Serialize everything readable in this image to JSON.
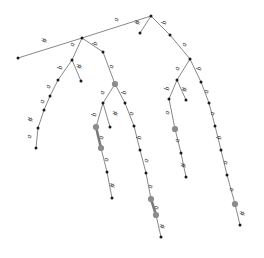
{
  "figure": {
    "alphabet": [
      "a",
      "b",
      "#"
    ],
    "colors": {
      "edge": "#555555",
      "edge_highlight": "#7a7a7a",
      "node": "#1a1a1a",
      "node_highlight": "#8c8c8c",
      "background": "#ffffff"
    },
    "width": 264,
    "height": 258
  },
  "nodes": [
    {
      "id": "n0",
      "x": 151,
      "y": 16,
      "kind": "internal"
    },
    {
      "id": "n1",
      "x": 82,
      "y": 38,
      "kind": "internal"
    },
    {
      "id": "n2",
      "x": 140,
      "y": 33,
      "kind": "leaf"
    },
    {
      "id": "n3",
      "x": 170,
      "y": 35,
      "kind": "internal"
    },
    {
      "id": "n4",
      "x": 18,
      "y": 58,
      "kind": "leaf"
    },
    {
      "id": "n5",
      "x": 72,
      "y": 60,
      "kind": "internal"
    },
    {
      "id": "n6",
      "x": 103,
      "y": 52,
      "kind": "internal"
    },
    {
      "id": "n7",
      "x": 190,
      "y": 59,
      "kind": "internal"
    },
    {
      "id": "n8",
      "x": 58,
      "y": 80,
      "kind": "internal"
    },
    {
      "id": "n9",
      "x": 81,
      "y": 81,
      "kind": "leaf"
    },
    {
      "id": "n10",
      "x": 115,
      "y": 84,
      "kind": "highlight"
    },
    {
      "id": "n11",
      "x": 177,
      "y": 80,
      "kind": "internal"
    },
    {
      "id": "n12",
      "x": 201,
      "y": 82,
      "kind": "internal"
    },
    {
      "id": "n13",
      "x": 50,
      "y": 96,
      "kind": "internal"
    },
    {
      "id": "n14",
      "x": 103,
      "y": 103,
      "kind": "internal"
    },
    {
      "id": "n15",
      "x": 125,
      "y": 103,
      "kind": "internal"
    },
    {
      "id": "n16",
      "x": 169,
      "y": 99,
      "kind": "internal"
    },
    {
      "id": "n17",
      "x": 186,
      "y": 100,
      "kind": "leaf"
    },
    {
      "id": "n18",
      "x": 209,
      "y": 103,
      "kind": "internal"
    },
    {
      "id": "n19",
      "x": 44,
      "y": 110,
      "kind": "internal"
    },
    {
      "id": "n20",
      "x": 96,
      "y": 127,
      "kind": "highlight"
    },
    {
      "id": "n21",
      "x": 110,
      "y": 127,
      "kind": "leaf"
    },
    {
      "id": "n22",
      "x": 134,
      "y": 126,
      "kind": "internal"
    },
    {
      "id": "n23",
      "x": 175,
      "y": 129,
      "kind": "highlight"
    },
    {
      "id": "n24",
      "x": 215,
      "y": 126,
      "kind": "internal"
    },
    {
      "id": "n25",
      "x": 38,
      "y": 128,
      "kind": "internal"
    },
    {
      "id": "n26",
      "x": 101,
      "y": 148,
      "kind": "highlight"
    },
    {
      "id": "n27",
      "x": 140,
      "y": 150,
      "kind": "internal"
    },
    {
      "id": "n28",
      "x": 181,
      "y": 153,
      "kind": "internal"
    },
    {
      "id": "n29",
      "x": 221,
      "y": 150,
      "kind": "internal"
    },
    {
      "id": "n30",
      "x": 36,
      "y": 148,
      "kind": "leaf"
    },
    {
      "id": "n31",
      "x": 107,
      "y": 172,
      "kind": "internal"
    },
    {
      "id": "n32",
      "x": 146,
      "y": 173,
      "kind": "internal"
    },
    {
      "id": "n33",
      "x": 186,
      "y": 177,
      "kind": "leaf"
    },
    {
      "id": "n34",
      "x": 227,
      "y": 175,
      "kind": "internal"
    },
    {
      "id": "n35",
      "x": 112,
      "y": 198,
      "kind": "leaf"
    },
    {
      "id": "n36",
      "x": 151,
      "y": 199,
      "kind": "highlight"
    },
    {
      "id": "n37",
      "x": 156,
      "y": 215,
      "kind": "highlight"
    },
    {
      "id": "n38",
      "x": 235,
      "y": 204,
      "kind": "highlight"
    },
    {
      "id": "n39",
      "x": 161,
      "y": 237,
      "kind": "leaf"
    },
    {
      "id": "n40",
      "x": 240,
      "y": 225,
      "kind": "leaf"
    }
  ],
  "edges": [
    {
      "from": "n0",
      "to": "n1",
      "label": "a",
      "lx": 118,
      "ly": 20,
      "style": "normal"
    },
    {
      "from": "n0",
      "to": "n2",
      "label": "#",
      "lx": 140,
      "ly": 23,
      "style": "normal"
    },
    {
      "from": "n0",
      "to": "n3",
      "label": "b",
      "lx": 166,
      "ly": 23,
      "style": "normal"
    },
    {
      "from": "n1",
      "to": "n4",
      "label": "#",
      "lx": 47,
      "ly": 41,
      "style": "normal"
    },
    {
      "from": "n1",
      "to": "n5",
      "label": "a",
      "lx": 74,
      "ly": 45,
      "style": "normal"
    },
    {
      "from": "n1",
      "to": "n6",
      "label": "b",
      "lx": 97,
      "ly": 44,
      "style": "normal"
    },
    {
      "from": "n3",
      "to": "n7",
      "label": "a",
      "lx": 186,
      "ly": 45,
      "style": "normal"
    },
    {
      "from": "n5",
      "to": "n8",
      "label": "b",
      "lx": 62,
      "ly": 68,
      "style": "normal"
    },
    {
      "from": "n5",
      "to": "n9",
      "label": "#",
      "lx": 82,
      "ly": 67,
      "style": "normal"
    },
    {
      "from": "n6",
      "to": "n10",
      "label": "a",
      "lx": 113,
      "ly": 67,
      "style": "normal"
    },
    {
      "from": "n7",
      "to": "n11",
      "label": "a",
      "lx": 179,
      "ly": 69,
      "style": "normal"
    },
    {
      "from": "n7",
      "to": "n12",
      "label": "b",
      "lx": 201,
      "ly": 69,
      "style": "normal"
    },
    {
      "from": "n8",
      "to": "n13",
      "label": "a",
      "lx": 50,
      "ly": 87,
      "style": "normal"
    },
    {
      "from": "n10",
      "to": "n14",
      "label": "a",
      "lx": 104,
      "ly": 93,
      "style": "normal"
    },
    {
      "from": "n10",
      "to": "n15",
      "label": "b",
      "lx": 126,
      "ly": 93,
      "style": "normal"
    },
    {
      "from": "n11",
      "to": "n16",
      "label": "b",
      "lx": 169,
      "ly": 89,
      "style": "normal"
    },
    {
      "from": "n11",
      "to": "n17",
      "label": "#",
      "lx": 187,
      "ly": 90,
      "style": "normal"
    },
    {
      "from": "n12",
      "to": "n18",
      "label": "a",
      "lx": 208,
      "ly": 92,
      "style": "normal"
    },
    {
      "from": "n13",
      "to": "n19",
      "label": "a",
      "lx": 44,
      "ly": 102,
      "style": "normal"
    },
    {
      "from": "n14",
      "to": "n20",
      "label": "b",
      "lx": 96,
      "ly": 115,
      "style": "normal"
    },
    {
      "from": "n14",
      "to": "n21",
      "label": "#",
      "lx": 118,
      "ly": 114,
      "style": "normal"
    },
    {
      "from": "n15",
      "to": "n22",
      "label": "a",
      "lx": 133,
      "ly": 114,
      "style": "normal"
    },
    {
      "from": "n16",
      "to": "n23",
      "label": "a",
      "lx": 169,
      "ly": 113,
      "style": "normal"
    },
    {
      "from": "n18",
      "to": "n24",
      "label": "a",
      "lx": 214,
      "ly": 114,
      "style": "normal"
    },
    {
      "from": "n19",
      "to": "n25",
      "label": "#",
      "lx": 33,
      "ly": 120,
      "style": "normal"
    },
    {
      "from": "n20",
      "to": "n26",
      "label": "a",
      "lx": 103,
      "ly": 138,
      "style": "thick"
    },
    {
      "from": "n22",
      "to": "n27",
      "label": "b",
      "lx": 141,
      "ly": 138,
      "style": "normal"
    },
    {
      "from": "n23",
      "to": "n28",
      "label": "a",
      "lx": 179,
      "ly": 141,
      "style": "normal"
    },
    {
      "from": "n24",
      "to": "n29",
      "label": "b",
      "lx": 221,
      "ly": 138,
      "style": "normal"
    },
    {
      "from": "n25",
      "to": "n30",
      "label": "a",
      "lx": 31,
      "ly": 137,
      "style": "normal"
    },
    {
      "from": "n26",
      "to": "n31",
      "label": "a",
      "lx": 108,
      "ly": 160,
      "style": "normal"
    },
    {
      "from": "n27",
      "to": "n32",
      "label": "a",
      "lx": 148,
      "ly": 161,
      "style": "normal"
    },
    {
      "from": "n28",
      "to": "n33",
      "label": "#",
      "lx": 186,
      "ly": 166,
      "style": "normal"
    },
    {
      "from": "n29",
      "to": "n34",
      "label": "a",
      "lx": 227,
      "ly": 163,
      "style": "normal"
    },
    {
      "from": "n31",
      "to": "n35",
      "label": "#",
      "lx": 115,
      "ly": 186,
      "style": "normal"
    },
    {
      "from": "n32",
      "to": "n36",
      "label": "a",
      "lx": 152,
      "ly": 187,
      "style": "normal"
    },
    {
      "from": "n34",
      "to": "n38",
      "label": "a",
      "lx": 233,
      "ly": 190,
      "style": "normal"
    },
    {
      "from": "n36",
      "to": "n37",
      "label": "a",
      "lx": 158,
      "ly": 208,
      "style": "thick"
    },
    {
      "from": "n37",
      "to": "n39",
      "label": "#",
      "lx": 165,
      "ly": 227,
      "style": "normal"
    },
    {
      "from": "n38",
      "to": "n40",
      "label": "#",
      "lx": 245,
      "ly": 214,
      "style": "normal"
    }
  ]
}
